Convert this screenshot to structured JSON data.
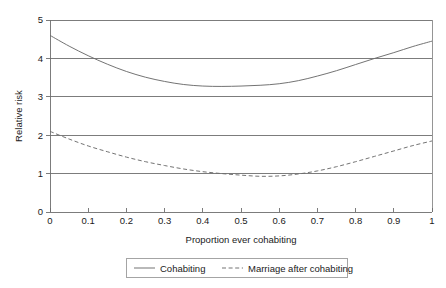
{
  "chart_data": {
    "type": "line",
    "title": "",
    "subtitle": "",
    "xlabel": "Proportion ever cohabiting",
    "ylabel": "Relative risk",
    "xlim": [
      0,
      1
    ],
    "ylim": [
      0,
      5
    ],
    "grid": "horizontal",
    "legend_position": "bottom",
    "xticks": [
      "0",
      "0.1",
      "0.2",
      "0.3",
      "0.4",
      "0.5",
      "0.6",
      "0.7",
      "0.8",
      "0.9",
      "1"
    ],
    "xtick_values": [
      0,
      0.1,
      0.2,
      0.3,
      0.4,
      0.5,
      0.6,
      0.7,
      0.8,
      0.9,
      1
    ],
    "yticks": [
      "0",
      "1",
      "2",
      "3",
      "4",
      "5"
    ],
    "ytick_values": [
      0,
      1,
      2,
      3,
      4,
      5
    ],
    "x": [
      0,
      0.05,
      0.1,
      0.15,
      0.2,
      0.25,
      0.3,
      0.35,
      0.4,
      0.45,
      0.5,
      0.55,
      0.6,
      0.65,
      0.7,
      0.75,
      0.8,
      0.85,
      0.9,
      0.95,
      1
    ],
    "series": [
      {
        "name": "Cohabiting",
        "style": "solid",
        "color": "#6b6b6b",
        "values": [
          4.6,
          4.32,
          4.07,
          3.85,
          3.66,
          3.51,
          3.4,
          3.32,
          3.28,
          3.27,
          3.28,
          3.3,
          3.34,
          3.42,
          3.54,
          3.68,
          3.84,
          4.0,
          4.15,
          4.31,
          4.45
        ]
      },
      {
        "name": "Marriage after cohabiting",
        "style": "dashed",
        "color": "#6b6b6b",
        "values": [
          2.1,
          1.9,
          1.72,
          1.57,
          1.43,
          1.31,
          1.21,
          1.12,
          1.05,
          1.0,
          0.96,
          0.93,
          0.94,
          0.99,
          1.07,
          1.18,
          1.31,
          1.45,
          1.59,
          1.73,
          1.85
        ]
      }
    ],
    "legend": [
      {
        "label": "Cohabiting",
        "style": "solid"
      },
      {
        "label": "Marriage after cohabiting",
        "style": "dashed"
      }
    ]
  },
  "axes": {
    "y_title": "Relative risk",
    "x_title": "Proportion ever cohabiting"
  },
  "colors": {
    "series": "#6b6b6b",
    "grid": "#6e6e6e",
    "frame": "#8a8a8a",
    "text": "#1a1a1a",
    "background": "#ffffff"
  }
}
